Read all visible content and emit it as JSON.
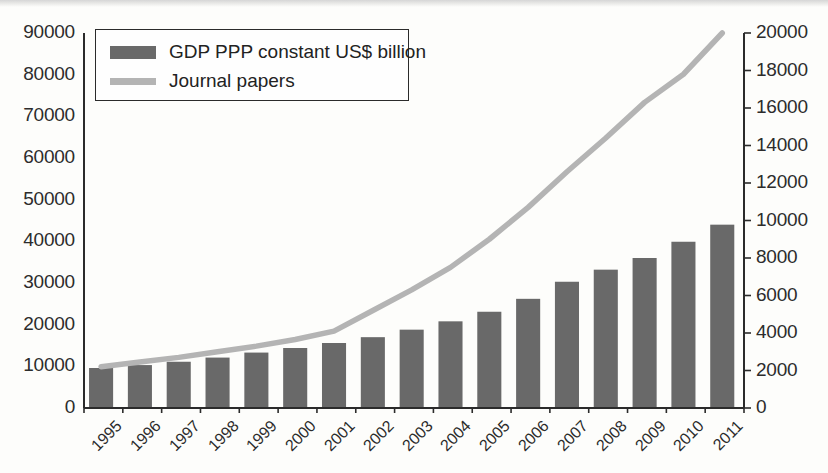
{
  "chart_data": {
    "type": "bar",
    "title": "",
    "xlabel": "",
    "ylabel": "",
    "grid": false,
    "legend_position": "top-left",
    "categories": [
      "1995",
      "1996",
      "1997",
      "1998",
      "1999",
      "2000",
      "2001",
      "2002",
      "2003",
      "2004",
      "2005",
      "2006",
      "2007",
      "2008",
      "2009",
      "2010",
      "2011"
    ],
    "axes": {
      "left": {
        "label": "GDP PPP constant US$ billion",
        "min": 0,
        "max": 90000,
        "step": 10000,
        "ticks": [
          "0",
          "10000",
          "20000",
          "30000",
          "40000",
          "50000",
          "60000",
          "70000",
          "80000",
          "90000"
        ]
      },
      "right": {
        "label": "Journal papers",
        "min": 0,
        "max": 20000,
        "step": 2000,
        "ticks": [
          "0",
          "2000",
          "4000",
          "6000",
          "8000",
          "10000",
          "12000",
          "14000",
          "16000",
          "18000",
          "20000"
        ]
      }
    },
    "series": [
      {
        "name": "GDP PPP constant US$ billion",
        "type": "bar",
        "axis": "left",
        "color": "#696969",
        "values": [
          9600,
          10300,
          11100,
          12100,
          13300,
          14400,
          15600,
          17000,
          18800,
          20800,
          23100,
          26200,
          30300,
          33200,
          36000,
          39900,
          44000
        ]
      },
      {
        "name": "Journal papers",
        "type": "line",
        "axis": "right",
        "color": "#b4b4b4",
        "values": [
          2200,
          2450,
          2700,
          3000,
          3300,
          3650,
          4100,
          5200,
          6300,
          7500,
          9000,
          10700,
          12600,
          14400,
          16300,
          17800,
          20000
        ]
      }
    ]
  },
  "legend": {
    "items": [
      {
        "label": "GDP PPP constant US$ billion",
        "marker": "bar-swatch"
      },
      {
        "label": "Journal papers",
        "marker": "line-swatch"
      }
    ]
  }
}
